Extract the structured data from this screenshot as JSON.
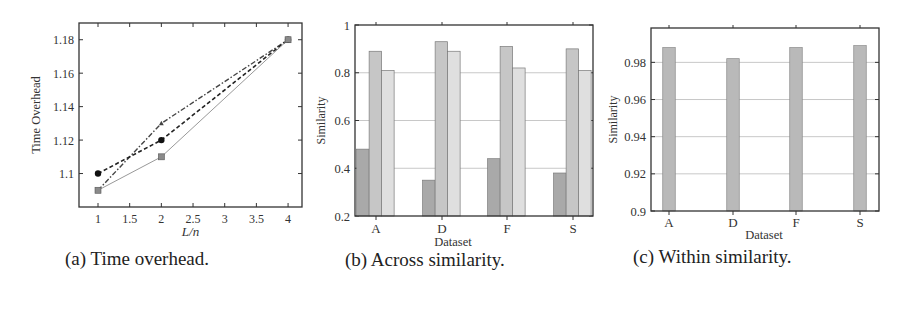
{
  "captions": {
    "a": "(a) Time overhead.",
    "b": "(b) Across similarity.",
    "c": "(c) Within similarity."
  },
  "colors": {
    "axis": "#333333",
    "grid": "#c8c8c8",
    "bar_dark": "#a9a9a9",
    "bar_mid": "#c6c6c6",
    "bar_light": "#dfdfdf",
    "bar_single": "#b9b9b9",
    "line_dashdot": "#444444",
    "line_dashed": "#222222",
    "line_solid": "#999999"
  },
  "chart_data": [
    {
      "id": "a",
      "type": "line",
      "title": "",
      "xlabel": "L/n",
      "ylabel": "Time Overhead",
      "xlim": [
        0.7,
        4.22
      ],
      "ylim": [
        1.08,
        1.19
      ],
      "xticks": [
        1,
        1.5,
        2,
        2.5,
        3,
        3.5,
        4
      ],
      "xtick_labels": [
        "1",
        "1.5",
        "2",
        "2.5",
        "3",
        "3.5",
        "4"
      ],
      "yticks": [
        1.1,
        1.12,
        1.14,
        1.16,
        1.18
      ],
      "ytick_labels": [
        "1.1",
        "1.12",
        "1.14",
        "1.16",
        "1.18"
      ],
      "grid": false,
      "legend": null,
      "x": [
        1,
        2,
        4
      ],
      "series": [
        {
          "name": "dash-dot (triangle)",
          "style": "dashdot",
          "marker": "triangle",
          "values": [
            1.09,
            1.13,
            1.18
          ]
        },
        {
          "name": "dashed (circle)",
          "style": "dashed",
          "marker": "circle",
          "values": [
            1.1,
            1.12,
            1.18
          ]
        },
        {
          "name": "solid (square)",
          "style": "solid",
          "marker": "square",
          "values": [
            1.09,
            1.11,
            1.18
          ]
        }
      ]
    },
    {
      "id": "b",
      "type": "bar",
      "title": "",
      "xlabel": "Dataset",
      "ylabel": "Similarity",
      "ylim": [
        0.2,
        1.0
      ],
      "yticks": [
        0.2,
        0.4,
        0.6,
        0.8,
        1.0
      ],
      "ytick_labels": [
        "0.2",
        "0.4",
        "0.6",
        "0.8",
        "1"
      ],
      "grid": true,
      "legend": null,
      "categories": [
        "A",
        "D",
        "F",
        "S"
      ],
      "series": [
        {
          "name": "series 1 (dark)",
          "values": [
            0.48,
            0.35,
            0.44,
            0.38
          ]
        },
        {
          "name": "series 2 (mid)",
          "values": [
            0.89,
            0.93,
            0.91,
            0.9
          ]
        },
        {
          "name": "series 3 (light)",
          "values": [
            0.81,
            0.89,
            0.82,
            0.81
          ]
        }
      ]
    },
    {
      "id": "c",
      "type": "bar",
      "title": "",
      "xlabel": "Dataset",
      "ylabel": "Similarity",
      "ylim": [
        0.9,
        0.9985
      ],
      "yticks": [
        0.9,
        0.92,
        0.94,
        0.96,
        0.98
      ],
      "ytick_labels": [
        "0.9",
        "0.92",
        "0.94",
        "0.96",
        "0.98"
      ],
      "grid": true,
      "legend": null,
      "categories": [
        "A",
        "D",
        "F",
        "S"
      ],
      "values": [
        0.988,
        0.982,
        0.988,
        0.989
      ]
    }
  ]
}
